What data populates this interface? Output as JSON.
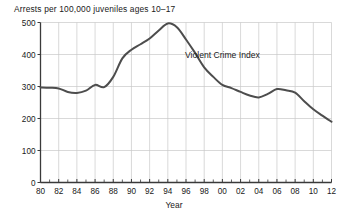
{
  "chart_data": {
    "type": "line",
    "title": "Arrests per 100,000 juveniles ages 10–17",
    "xlabel": "Year",
    "ylabel": "",
    "xlim": [
      1980,
      2012
    ],
    "ylim": [
      0,
      500
    ],
    "grid": true,
    "legend_position": "inline-annotation",
    "y_ticks": [
      0,
      100,
      200,
      300,
      400,
      500
    ],
    "y_tick_labels": [
      "0",
      "100",
      "200",
      "300",
      "400",
      "500"
    ],
    "x_ticks": [
      1980,
      1982,
      1984,
      1986,
      1988,
      1990,
      1992,
      1994,
      1996,
      1998,
      2000,
      2002,
      2004,
      2006,
      2008,
      2010,
      2012
    ],
    "x_tick_labels": [
      "80",
      "82",
      "84",
      "86",
      "88",
      "90",
      "92",
      "94",
      "96",
      "98",
      "00",
      "02",
      "04",
      "06",
      "08",
      "10",
      "12"
    ],
    "x_minor_tick_interval": 1,
    "annotations": [
      {
        "text": "Violent Crime Index",
        "x": 2000,
        "y": 390
      }
    ],
    "series": [
      {
        "name": "Violent Crime Index",
        "color": "#4d4d4d",
        "x": [
          1980,
          1981,
          1982,
          1983,
          1984,
          1985,
          1986,
          1987,
          1988,
          1989,
          1990,
          1991,
          1992,
          1993,
          1994,
          1995,
          1996,
          1997,
          1998,
          1999,
          2000,
          2001,
          2002,
          2003,
          2004,
          2005,
          2006,
          2007,
          2008,
          2009,
          2010,
          2011,
          2012
        ],
        "values": [
          297,
          296,
          294,
          283,
          280,
          287,
          305,
          298,
          330,
          388,
          415,
          432,
          450,
          475,
          497,
          485,
          447,
          405,
          360,
          330,
          305,
          295,
          283,
          272,
          266,
          277,
          292,
          288,
          281,
          254,
          229,
          209,
          190
        ]
      }
    ]
  },
  "labels": {
    "title": "Arrests per 100,000 juveniles ages 10–17",
    "xaxis": "Year",
    "series_annotation": "Violent Crime Index"
  }
}
